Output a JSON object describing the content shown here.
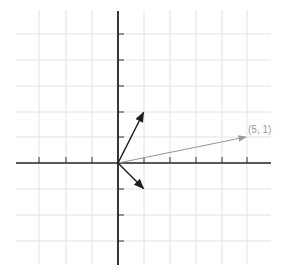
{
  "diagram": {
    "type": "vector-plot",
    "grid": {
      "x_range": [
        -4,
        5
      ],
      "y_range": [
        -4,
        5
      ],
      "unit_px": 25.8
    },
    "colors": {
      "grid": "#e2e2e2",
      "axis": "#222222",
      "vector_dark": "#1f1f1f",
      "vector_light": "#999999",
      "label": "#999999"
    },
    "vectors": [
      {
        "name": "vector-1-2",
        "x": 1,
        "y": 2,
        "style": "dark",
        "label": ""
      },
      {
        "name": "vector-1-neg1",
        "x": 1,
        "y": -1,
        "style": "dark",
        "label": ""
      },
      {
        "name": "vector-5-1",
        "x": 5,
        "y": 1,
        "style": "light",
        "label": "(5, 1)"
      }
    ]
  }
}
